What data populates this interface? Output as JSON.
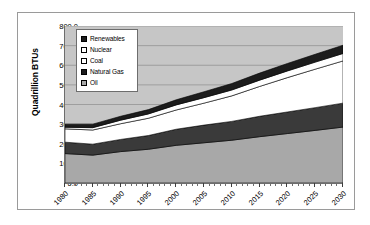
{
  "chart_data": {
    "type": "area",
    "stacked": true,
    "title": "",
    "xlabel": "",
    "ylabel": "Quadrillion BTUs",
    "ylim": [
      0,
      800
    ],
    "ytick_step": 100,
    "ytick_labels": [
      "800.0",
      "700.0",
      "600.0",
      "500.0",
      "400.0",
      "300.0",
      "200.0",
      "100.0",
      "0.0"
    ],
    "ytick_values": [
      800,
      700,
      600,
      500,
      400,
      300,
      200,
      100,
      0
    ],
    "xlim": [
      1980,
      2030
    ],
    "xtick_labels": [
      "1980",
      "1985",
      "1990",
      "1995",
      "2000",
      "2005",
      "2010",
      "2015",
      "2020",
      "2025",
      "2030"
    ],
    "xtick_values": [
      1980,
      1985,
      1990,
      1995,
      2000,
      2005,
      2010,
      2015,
      2020,
      2025,
      2030
    ],
    "xtick_minor_step": 1,
    "grid": "horizontal",
    "legend_position": "upper-left-inset",
    "plot_background": "#c6c6c6",
    "x": [
      1980,
      1985,
      1990,
      1995,
      2000,
      2005,
      2010,
      2015,
      2020,
      2025,
      2030
    ],
    "series": [
      {
        "name": "Oil",
        "color": "#a8a8a8",
        "swatch": "gray",
        "values": [
          150,
          142,
          160,
          172,
          192,
          205,
          218,
          236,
          252,
          268,
          285
        ]
      },
      {
        "name": "Natural Gas",
        "color": "#3a3a3a",
        "swatch": "black",
        "values": [
          58,
          56,
          62,
          70,
          82,
          90,
          96,
          104,
          110,
          116,
          122
        ]
      },
      {
        "name": "Coal",
        "color": "#ffffff",
        "swatch": "white",
        "values": [
          68,
          72,
          80,
          88,
          98,
          112,
          130,
          152,
          175,
          196,
          215
        ]
      },
      {
        "name": "Nuclear",
        "color": "#ffffff",
        "swatch": "white",
        "values": [
          8,
          12,
          18,
          22,
          26,
          28,
          30,
          32,
          34,
          36,
          38
        ]
      },
      {
        "name": "Renewables",
        "color": "#1c1c1c",
        "swatch": "black",
        "values": [
          16,
          18,
          20,
          22,
          26,
          30,
          33,
          36,
          38,
          40,
          42
        ]
      }
    ],
    "totals": [
      300,
      300,
      340,
      374,
      424,
      465,
      507,
      560,
      609,
      656,
      702
    ],
    "legend_entries": [
      {
        "label": "Renewables",
        "swatch": "black"
      },
      {
        "label": "Nuclear",
        "swatch": "white"
      },
      {
        "label": "Coal",
        "swatch": "white"
      },
      {
        "label": "Natural Gas",
        "swatch": "black"
      },
      {
        "label": "Oil",
        "swatch": "gray"
      }
    ]
  },
  "colors": {
    "plot_bg": "#c6c6c6",
    "gridline": "#8d8d8d",
    "axis": "#6d6d6d",
    "frame": "#9a9a9a",
    "oil": "#a8a8a8",
    "natural_gas": "#3a3a3a",
    "coal": "#ffffff",
    "nuclear": "#ffffff",
    "renewables": "#1c1c1c"
  }
}
